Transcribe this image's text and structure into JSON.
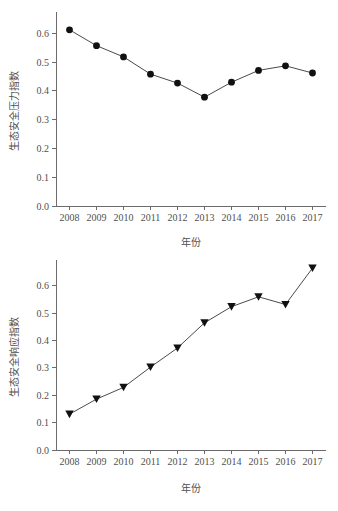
{
  "figure": {
    "background": "#ffffff",
    "line_color": "#4a4a4a",
    "marker_color": "#111111",
    "axis_color": "#6b6b6b",
    "text_color": "#4f4f4f"
  },
  "chart_data": [
    {
      "type": "line",
      "id": "ecological-security-pressure-index",
      "title": "",
      "xlabel": "年份",
      "ylabel": "生态安全压力指数",
      "marker": "circle",
      "grid": false,
      "legend": "none",
      "xlim": [
        2007.5,
        2017.5
      ],
      "ylim": [
        0.0,
        0.66
      ],
      "yticks": [
        "0.0",
        "0.1",
        "0.2",
        "0.3",
        "0.4",
        "0.5",
        "0.6"
      ],
      "ytick_values": [
        0.0,
        0.1,
        0.2,
        0.3,
        0.4,
        0.5,
        0.6
      ],
      "categories": [
        "2008",
        "2009",
        "2010",
        "2011",
        "2012",
        "2013",
        "2014",
        "2015",
        "2016",
        "2017"
      ],
      "x": [
        2008,
        2009,
        2010,
        2011,
        2012,
        2013,
        2014,
        2015,
        2016,
        2017
      ],
      "values": [
        0.612,
        0.557,
        0.518,
        0.458,
        0.427,
        0.378,
        0.43,
        0.471,
        0.487,
        0.462
      ]
    },
    {
      "type": "line",
      "id": "ecological-security-response-index",
      "title": "",
      "xlabel": "年份",
      "ylabel": "生态安全响应指数",
      "marker": "triangle-down",
      "grid": false,
      "legend": "none",
      "xlim": [
        2007.5,
        2017.5
      ],
      "ylim": [
        0.0,
        0.68
      ],
      "yticks": [
        "0.0",
        "0.1",
        "0.2",
        "0.3",
        "0.4",
        "0.5",
        "0.6"
      ],
      "ytick_values": [
        0.0,
        0.1,
        0.2,
        0.3,
        0.4,
        0.5,
        0.6
      ],
      "categories": [
        "2008",
        "2009",
        "2010",
        "2011",
        "2012",
        "2013",
        "2014",
        "2015",
        "2016",
        "2017"
      ],
      "x": [
        2008,
        2009,
        2010,
        2011,
        2012,
        2013,
        2014,
        2015,
        2016,
        2017
      ],
      "values": [
        0.131,
        0.186,
        0.229,
        0.303,
        0.373,
        0.465,
        0.524,
        0.56,
        0.532,
        0.665
      ]
    }
  ]
}
